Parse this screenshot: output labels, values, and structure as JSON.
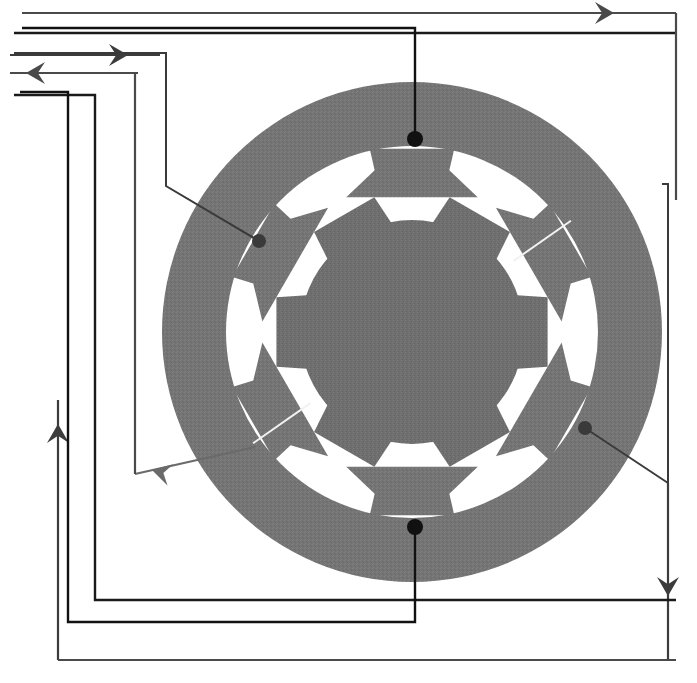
{
  "figure": {
    "kind": "machine-cross-section-diagram",
    "background_color": "#ffffff",
    "canvas": {
      "width": 697,
      "height": 683
    }
  },
  "colors": {
    "iron_gray": "#757575",
    "iron_gray_alt": "#6f6f6f",
    "air_gap_white": "#ffffff",
    "leader_black": "#111111",
    "leader_gray": "#5a5a5a",
    "dot_black": "#111111",
    "slit_white": "#f2f2f2"
  },
  "machine": {
    "label": "rotating-machine-cross-section",
    "center": {
      "x": 412,
      "y": 332
    },
    "stator": {
      "label": "stator-ring",
      "outer_radius": 250,
      "yoke_inner_radius": 186,
      "tooth_tip_radius": 150,
      "tooth_count": 6,
      "tooth_half_angle_deg": 13,
      "tooth_shoe_half_angle_deg": 26,
      "first_tooth_angle_deg": -90
    },
    "rotor": {
      "label": "rotor-core",
      "body_radius": 112,
      "pole_tip_radius": 140,
      "pole_count": 6,
      "pole_half_angle_deg": 20,
      "first_pole_angle_deg": -60
    },
    "slit": {
      "label": "rotor-lamination-slit",
      "angle_a_deg": -35,
      "angle_b_deg": 145,
      "inner_radius": 112,
      "outer_radius": 186,
      "width": 2
    }
  },
  "callouts": [
    {
      "id": "callout-top",
      "dot": {
        "x": 415,
        "y": 139
      },
      "dot_radius": 8,
      "color": "#111111",
      "stroke_width": 2.4,
      "path": "M 415 139 L 415 28 L 22 28"
    },
    {
      "id": "callout-upper-left",
      "dot": {
        "x": 259,
        "y": 241
      },
      "dot_radius": 7,
      "color": "#3a3a3a",
      "stroke_width": 2.0,
      "path": "M 259 241 L 166 186 L 166 53 L 14 53"
    },
    {
      "id": "callout-bottom",
      "dot": {
        "x": 415,
        "y": 527
      },
      "dot_radius": 8,
      "color": "#111111",
      "stroke_width": 2.4,
      "path": "M 415 527 L 415 622 L 68 622 L 68 92 L 20 92"
    },
    {
      "id": "callout-right",
      "dot": {
        "x": 585,
        "y": 428
      },
      "dot_radius": 7,
      "color": "#3a3a3a",
      "stroke_width": 2.0,
      "path": "M 585 428 L 668 483 L 668 184 L 662 184"
    }
  ],
  "routes": [
    {
      "id": "route-outer-top-to-right",
      "color": "#4a4a4a",
      "stroke_width": 2.2,
      "path": "M 22 13 L 676 13",
      "arrow": {
        "at": {
          "x": 614,
          "y": 13
        },
        "direction": "right",
        "name": "arrow-right-top"
      }
    },
    {
      "id": "route-top-second",
      "color": "#1a1a1a",
      "stroke_width": 2.6,
      "path": "M 14 33 L 676 33",
      "arrow": null
    },
    {
      "id": "route-feed-right-arrow",
      "color": "#3c3c3c",
      "stroke_width": 2.2,
      "path": "M 10 55 L 160 55",
      "arrow": {
        "at": {
          "x": 128,
          "y": 55
        },
        "direction": "right",
        "name": "arrow-right-upper-left"
      }
    },
    {
      "id": "route-return-left-arrow",
      "color": "#4a4a4a",
      "stroke_width": 2.2,
      "path": "M 138 73 L 10 73",
      "arrow": {
        "at": {
          "x": 26,
          "y": 73
        },
        "direction": "left",
        "name": "arrow-left-upper"
      }
    },
    {
      "id": "route-left-up",
      "color": "#3c3c3c",
      "stroke_width": 2.2,
      "path": "M 58 660 L 58 400",
      "arrow": {
        "at": {
          "x": 58,
          "y": 424
        },
        "direction": "up",
        "name": "arrow-up-left"
      }
    },
    {
      "id": "route-right-down",
      "color": "#3c3c3c",
      "stroke_width": 2.2,
      "path": "M 668 483 L 668 660",
      "arrow": {
        "at": {
          "x": 668,
          "y": 596
        },
        "direction": "down",
        "name": "arrow-down-right"
      }
    },
    {
      "id": "route-diagonal-into-rotor",
      "color": "#6a6a6a",
      "stroke_width": 2.2,
      "path": "M 135 474 L 255 447",
      "arrow": {
        "at": {
          "x": 152,
          "y": 470
        },
        "direction": "left-down",
        "name": "arrow-diagonal-rotor"
      }
    },
    {
      "id": "route-left-frame-outer",
      "color": "#1a1a1a",
      "stroke_width": 2.4,
      "path": "M 14 95 L 95 95 L 95 600 L 676 600",
      "arrow": null
    },
    {
      "id": "route-left-frame-inner",
      "color": "#4a4a4a",
      "stroke_width": 2.2,
      "path": "M 10 73 L 135 73 L 135 474",
      "arrow": null
    },
    {
      "id": "route-bottom-frame",
      "color": "#4a4a4a",
      "stroke_width": 2.2,
      "path": "M 58 660 L 676 660",
      "arrow": null
    },
    {
      "id": "route-top-right-descend",
      "color": "#4a4a4a",
      "stroke_width": 2.2,
      "path": "M 676 13 L 676 200",
      "arrow": null
    }
  ],
  "arrow_glyphs": {
    "right": "➤",
    "left": "⬅",
    "up": "⬆",
    "down": "⬇"
  }
}
